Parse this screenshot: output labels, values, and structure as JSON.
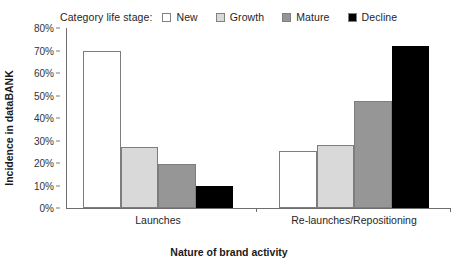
{
  "chart_data": {
    "type": "bar",
    "title": "",
    "xlabel": "Nature of brand activity",
    "ylabel": "Incidence in dataBANK",
    "categories": [
      "Launches",
      "Re-launches/Repositioning"
    ],
    "series": [
      {
        "name": "New",
        "values": [
          70,
          25.5
        ],
        "color": "#ffffff"
      },
      {
        "name": "Growth",
        "values": [
          27,
          28
        ],
        "color": "#d9d9d9"
      },
      {
        "name": "Mature",
        "values": [
          19.5,
          47.5
        ],
        "color": "#969696"
      },
      {
        "name": "Decline",
        "values": [
          10,
          72
        ],
        "color": "#000000"
      }
    ],
    "ylim": [
      0,
      80
    ],
    "yticks": [
      "0%",
      "10%",
      "20%",
      "30%",
      "40%",
      "50%",
      "60%",
      "70%",
      "80%"
    ],
    "ytick_values": [
      0,
      10,
      20,
      30,
      40,
      50,
      60,
      70,
      80
    ],
    "grid": false,
    "legend_position": "top"
  },
  "legend": {
    "title": "Category life stage:",
    "entries": [
      {
        "label": "New",
        "color": "#ffffff"
      },
      {
        "label": "Growth",
        "color": "#d9d9d9"
      },
      {
        "label": "Mature",
        "color": "#969696"
      },
      {
        "label": "Decline",
        "color": "#000000"
      }
    ]
  },
  "axes": {
    "y_title": "Incidence in dataBANK",
    "x_title": "Nature of brand activity"
  }
}
